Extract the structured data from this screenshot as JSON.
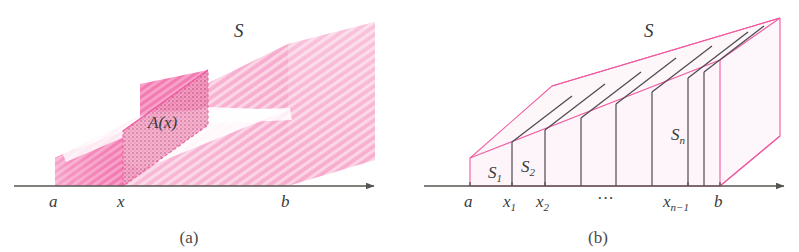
{
  "figure": {
    "panels": [
      {
        "id": "a",
        "caption": "(a)",
        "solid_label": "S",
        "cross_section_label": "A(x)",
        "axis_labels": [
          "a",
          "x",
          "b"
        ]
      },
      {
        "id": "b",
        "caption": "(b)",
        "solid_label": "S",
        "slab_labels": [
          "S₁",
          "S₂",
          "Sₙ"
        ],
        "axis_labels": [
          "a",
          "x₁",
          "x₂",
          "⋯",
          "xₙ₋₁",
          "b"
        ]
      }
    ]
  },
  "panel_a": {
    "caption": "(a)",
    "label_S": "S",
    "label_Ax": "A(x)",
    "label_a": "a",
    "label_x": "x",
    "label_b": "b"
  },
  "panel_b": {
    "caption": "(b)",
    "label_S": "S",
    "label_S1": "S",
    "label_S1_sub": "1",
    "label_S2": "S",
    "label_S2_sub": "2",
    "label_Sn": "S",
    "label_Sn_sub": "n",
    "label_a": "a",
    "label_x1": "x",
    "label_x1_sub": "1",
    "label_x2": "x",
    "label_x2_sub": "2",
    "label_dots": "···",
    "label_xn1": "x",
    "label_xn1_sub": "n−1",
    "label_b": "b"
  },
  "colors": {
    "pink_edge": "#ef5ba1",
    "pink_mid": "#f472ab",
    "pink_deep": "#f04e9b",
    "pink_pale": "#fbd8e8",
    "pink_faint": "#fdeef5",
    "axis": "#56544f",
    "dark_edge": "#4e4a52",
    "text": "#3a3a3a"
  }
}
